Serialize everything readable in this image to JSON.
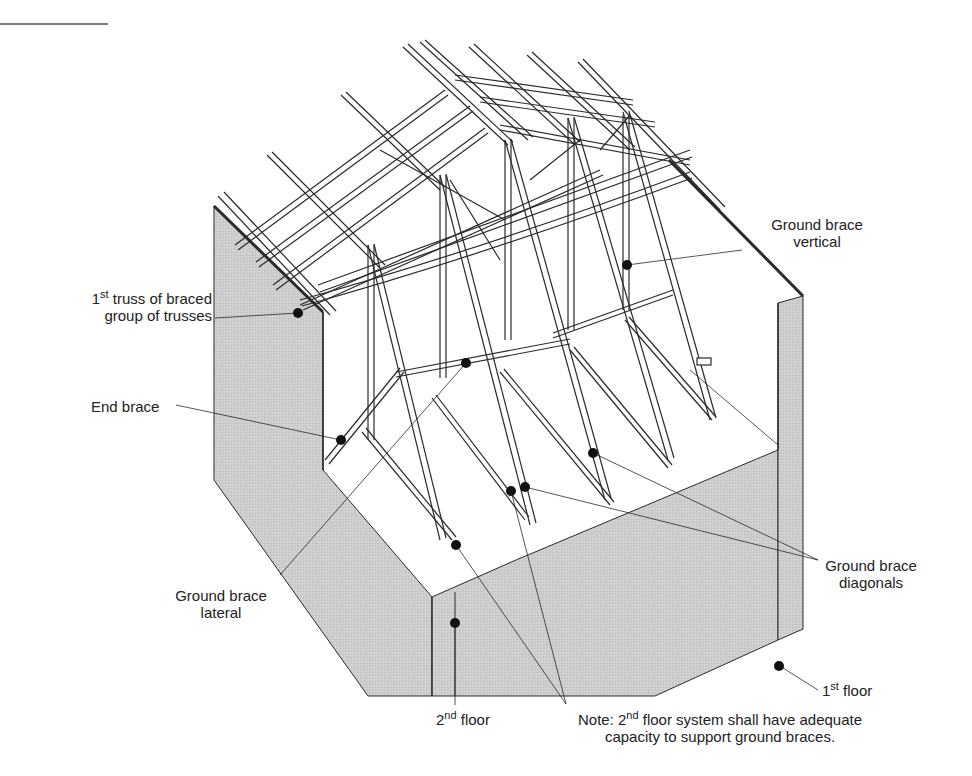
{
  "diagram": {
    "type": "isometric-cutaway",
    "colors": {
      "wall_fill": "#cfcfcf",
      "line": "#2a2a2a",
      "lumber_fill": "#ffffff",
      "dot": "#111111"
    }
  },
  "labels": {
    "ground_brace_vertical": {
      "line1": "Ground brace",
      "line2": "vertical"
    },
    "first_truss": {
      "sup_num": "1",
      "sup": "st",
      "line1_rest": " truss of braced",
      "line2": "group of trusses"
    },
    "end_brace": {
      "text": "End brace"
    },
    "ground_brace_diagonals": {
      "line1": "Ground brace",
      "line2": "diagonals"
    },
    "ground_brace_lateral": {
      "line1": "Ground brace",
      "line2": "lateral"
    },
    "first_floor": {
      "num": "1",
      "sup": "st",
      "rest": " floor"
    },
    "second_floor": {
      "num": "2",
      "sup": "nd",
      "rest": " floor"
    },
    "note": {
      "prefix": "Note: 2",
      "sup": "nd",
      "line1_rest": " floor system shall have adequate",
      "line2": "capacity to support ground braces."
    }
  }
}
